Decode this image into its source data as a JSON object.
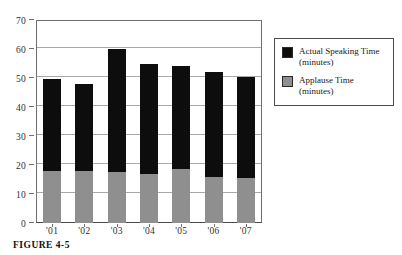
{
  "chart_data": {
    "type": "bar",
    "subtype": "stacked",
    "title": "",
    "xlabel": "",
    "ylabel": "",
    "ylim": [
      0,
      70
    ],
    "ytick_step": 10,
    "yticks": [
      0,
      10,
      20,
      30,
      40,
      50,
      60,
      70
    ],
    "ytick_labels": [
      "0",
      "10",
      "20",
      "30",
      "40",
      "50",
      "60",
      "70"
    ],
    "grid": true,
    "grid_axis": "y",
    "legend_position": "right-outside",
    "categories": [
      "'01",
      "'02",
      "'03",
      "'04",
      "'05",
      "'06",
      "'07"
    ],
    "series": [
      {
        "name": "Applause Time (minutes)",
        "color": "#8f8f8f",
        "values": [
          18,
          18,
          17.5,
          17,
          18.5,
          16,
          15.5
        ]
      },
      {
        "name": "Actual Speaking Time (minutes)",
        "color": "#0d0d0d",
        "values": [
          31.5,
          30,
          42.5,
          38,
          35.5,
          36,
          35
        ]
      }
    ],
    "totals": [
      49.5,
      48,
      60,
      55,
      54,
      52,
      50.5
    ]
  },
  "legend": {
    "entries": [
      {
        "label": "Actual Speaking Time",
        "units": "(minutes)",
        "swatch": "black-square-swatch"
      },
      {
        "label": "Applause Time",
        "units": "(minutes)",
        "swatch": "gray-square-swatch"
      }
    ]
  },
  "caption": {
    "text": "FIGURE 4-5"
  }
}
